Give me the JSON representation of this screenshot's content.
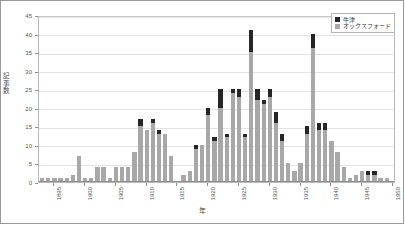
{
  "chart_data": {
    "type": "bar",
    "subtype": "stacked-bar",
    "title": "",
    "xlabel": "年",
    "ylabel": "記事数",
    "ylim": [
      0,
      45
    ],
    "ytick_step": 5,
    "ytick_labels": [
      "0",
      "5",
      "10",
      "15",
      "20",
      "25",
      "30",
      "35",
      "40",
      "45"
    ],
    "grid": true,
    "grid_axis": "y",
    "legend_position": "top-right",
    "legend": [
      {
        "name": "牛津",
        "color": "#262626"
      },
      {
        "name": "オックスフォード",
        "color": "#a8a8a8"
      }
    ],
    "xtick_labels": [
      "1895",
      "1900",
      "1905",
      "1910",
      "1915",
      "1920",
      "1925",
      "1930",
      "1935",
      "1940",
      "1945",
      "1950"
    ],
    "categories": [
      "1893",
      "1894",
      "1895",
      "1896",
      "1897",
      "1898",
      "1899",
      "1900",
      "1901",
      "1902",
      "1903",
      "1904",
      "1905",
      "1906",
      "1907",
      "1908",
      "1909",
      "1910",
      "1911",
      "1912",
      "1913",
      "1914",
      "1915",
      "1916",
      "1917",
      "1918",
      "1919",
      "1920",
      "1921",
      "1922",
      "1923",
      "1924",
      "1925",
      "1926",
      "1927",
      "1928",
      "1929",
      "1930",
      "1931",
      "1932",
      "1933",
      "1934",
      "1935",
      "1936",
      "1937",
      "1938",
      "1939",
      "1940",
      "1941",
      "1942",
      "1943",
      "1944",
      "1945",
      "1946",
      "1947",
      "1948",
      "1949",
      "1950"
    ],
    "series": [
      {
        "name": "オックスフォード",
        "color": "#a8a8a8",
        "values": [
          1,
          1,
          1,
          1,
          1,
          2,
          7,
          1,
          1,
          4,
          4,
          1,
          4,
          4,
          4,
          8,
          15,
          14,
          16,
          13,
          13,
          7,
          0,
          2,
          3,
          9,
          10,
          18,
          11,
          20,
          12,
          24,
          23,
          12,
          35,
          22,
          21,
          23,
          16,
          11,
          5,
          3,
          5,
          13,
          36,
          14,
          14,
          11,
          8,
          4,
          1,
          2,
          3,
          2,
          2,
          1,
          1,
          0
        ]
      },
      {
        "name": "牛津",
        "color": "#262626",
        "values": [
          0,
          0,
          0,
          0,
          0,
          0,
          0,
          0,
          0,
          0,
          0,
          0,
          0,
          0,
          0,
          0,
          2,
          0,
          1,
          1,
          0,
          0,
          0,
          0,
          0,
          1,
          0,
          2,
          1,
          5,
          1,
          1,
          2,
          1,
          6,
          3,
          1,
          2,
          3,
          2,
          0,
          0,
          0,
          2,
          4,
          2,
          2,
          0,
          0,
          0,
          0,
          0,
          0,
          1,
          1,
          0,
          0,
          0
        ]
      }
    ]
  }
}
